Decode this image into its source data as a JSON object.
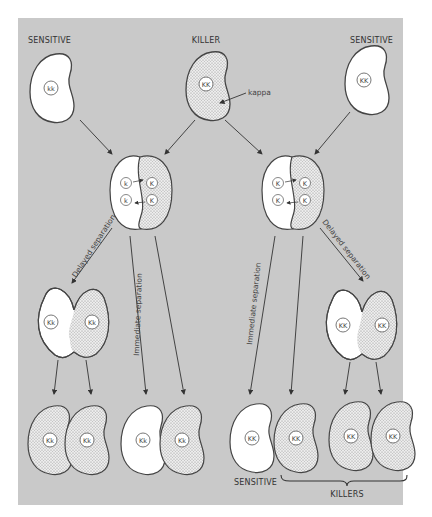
{
  "diagram": {
    "colors": {
      "background": "#ffffff",
      "panel": "#c9c9c9",
      "cell_outline": "#444444",
      "sensitive_fill": "#ffffff",
      "killer_fill": "#e6e6e6"
    },
    "top_row": {
      "left": {
        "label": "SENSITIVE",
        "genotype": "kk",
        "type": "sensitive"
      },
      "center": {
        "label": "KILLER",
        "genotype": "KK",
        "type": "killer",
        "annotation": "kappa"
      },
      "right": {
        "label": "SENSITIVE",
        "genotype": "KK",
        "type": "sensitive"
      }
    },
    "conjugation": {
      "left": {
        "genotypes": [
          "k",
          "K",
          "k",
          "K"
        ]
      },
      "right": {
        "genotypes": [
          "K",
          "K",
          "K",
          "K"
        ]
      }
    },
    "process_labels": {
      "delayed_left": "Delayed separation",
      "immediate_left": "Immediate separation",
      "immediate_right": "Immediate separation",
      "delayed_right": "Delayed separation"
    },
    "delayed_cells": {
      "left": {
        "genotypes": [
          "Kk",
          "Kk"
        ]
      },
      "right": {
        "genotypes": [
          "KK",
          "KK"
        ]
      }
    },
    "progeny": [
      {
        "genotype": "Kk",
        "type": "killer"
      },
      {
        "genotype": "Kk",
        "type": "killer"
      },
      {
        "genotype": "Kk",
        "type": "sensitive"
      },
      {
        "genotype": "Kk",
        "type": "killer"
      },
      {
        "genotype": "KK",
        "type": "sensitive"
      },
      {
        "genotype": "KK",
        "type": "killer"
      },
      {
        "genotype": "KK",
        "type": "killer"
      },
      {
        "genotype": "KK",
        "type": "killer"
      }
    ],
    "bottom_labels": {
      "sensitive": "SENSITIVE",
      "killers": "KILLERS"
    }
  }
}
